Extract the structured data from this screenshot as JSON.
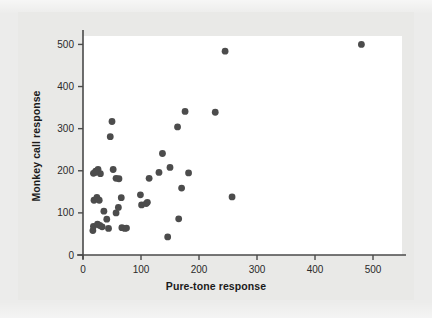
{
  "figure": {
    "background_color": "#ececeb",
    "panel_color": "#e9e9e7",
    "plot_background_color": "#ffffff",
    "axis_color": "#4a4a4a",
    "point_color": "#4c4c4c"
  },
  "chart_data": {
    "type": "scatter",
    "title": "",
    "xlabel": "Pure-tone response",
    "ylabel": "Monkey call response",
    "xlim": [
      0,
      550
    ],
    "ylim": [
      0,
      520
    ],
    "xticks": [
      0,
      100,
      200,
      300,
      400,
      500
    ],
    "yticks": [
      0,
      100,
      200,
      300,
      400,
      500
    ],
    "xtick_labels": [
      "0",
      "100",
      "200",
      "300",
      "400",
      "500"
    ],
    "ytick_labels": [
      "0",
      "100",
      "200",
      "300",
      "400",
      "500"
    ],
    "grid": false,
    "legend": "none",
    "marker": "circle",
    "marker_size": 3.4,
    "n_points": 45,
    "points": [
      {
        "x": 18,
        "y": 194
      },
      {
        "x": 22,
        "y": 199
      },
      {
        "x": 26,
        "y": 203
      },
      {
        "x": 30,
        "y": 193
      },
      {
        "x": 19,
        "y": 130
      },
      {
        "x": 24,
        "y": 137
      },
      {
        "x": 28,
        "y": 130
      },
      {
        "x": 18,
        "y": 68
      },
      {
        "x": 17,
        "y": 58
      },
      {
        "x": 25,
        "y": 73
      },
      {
        "x": 29,
        "y": 70
      },
      {
        "x": 36,
        "y": 104
      },
      {
        "x": 41,
        "y": 85
      },
      {
        "x": 44,
        "y": 63
      },
      {
        "x": 47,
        "y": 281
      },
      {
        "x": 50,
        "y": 317
      },
      {
        "x": 52,
        "y": 203
      },
      {
        "x": 57,
        "y": 182
      },
      {
        "x": 57,
        "y": 100
      },
      {
        "x": 61,
        "y": 113
      },
      {
        "x": 66,
        "y": 136
      },
      {
        "x": 67,
        "y": 65
      },
      {
        "x": 72,
        "y": 63
      },
      {
        "x": 75,
        "y": 64
      },
      {
        "x": 99,
        "y": 143
      },
      {
        "x": 101,
        "y": 119
      },
      {
        "x": 111,
        "y": 125
      },
      {
        "x": 114,
        "y": 182
      },
      {
        "x": 131,
        "y": 196
      },
      {
        "x": 137,
        "y": 241
      },
      {
        "x": 146,
        "y": 43
      },
      {
        "x": 150,
        "y": 208
      },
      {
        "x": 163,
        "y": 304
      },
      {
        "x": 165,
        "y": 86
      },
      {
        "x": 170,
        "y": 159
      },
      {
        "x": 176,
        "y": 341
      },
      {
        "x": 182,
        "y": 195
      },
      {
        "x": 228,
        "y": 339
      },
      {
        "x": 245,
        "y": 484
      },
      {
        "x": 257,
        "y": 138
      },
      {
        "x": 480,
        "y": 500
      },
      {
        "x": 21,
        "y": 196
      },
      {
        "x": 33,
        "y": 67
      },
      {
        "x": 62,
        "y": 181
      },
      {
        "x": 109,
        "y": 122
      }
    ]
  }
}
